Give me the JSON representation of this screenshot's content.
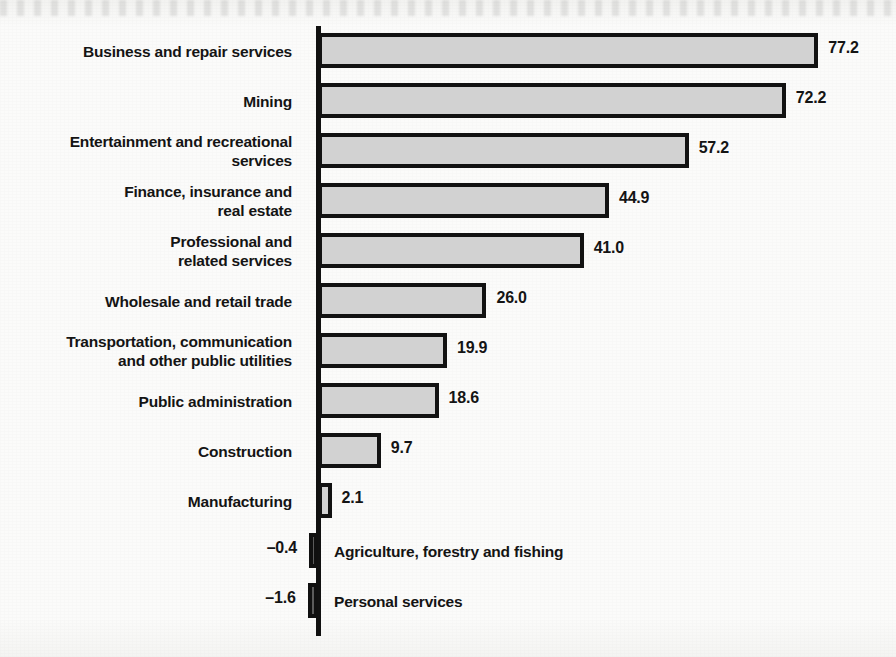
{
  "chart_data": {
    "type": "bar",
    "orientation": "horizontal",
    "title": "",
    "xlabel": "",
    "ylabel": "",
    "grid": false,
    "legend": "none",
    "xlim": [
      -5,
      80
    ],
    "zero_axis": 0,
    "categories": [
      "Business and repair services",
      "Mining",
      "Entertainment and recreational services",
      "Finance, insurance and real estate",
      "Professional and related services",
      "Wholesale and retail trade",
      "Transportation, communication and other public utilities",
      "Public administration",
      "Construction",
      "Manufacturing",
      "Agriculture, forestry and fishing",
      "Personal services"
    ],
    "values": [
      77.2,
      72.2,
      57.2,
      44.9,
      41.0,
      26.0,
      19.9,
      18.6,
      9.7,
      2.1,
      -0.4,
      -1.6
    ],
    "value_labels": [
      "77.2",
      "72.2",
      "57.2",
      "44.9",
      "41.0",
      "26.0",
      "19.9",
      "18.6",
      "9.7",
      "2.1",
      "–0.4",
      "–1.6"
    ]
  },
  "bars": [
    {
      "label_line1": "Business and repair services",
      "label_line2": "",
      "value_label": "77.2",
      "value": 77.2,
      "negative": false,
      "label_inside": false
    },
    {
      "label_line1": "Mining",
      "label_line2": "",
      "value_label": "72.2",
      "value": 72.2,
      "negative": false,
      "label_inside": false
    },
    {
      "label_line1": "Entertainment and recreational",
      "label_line2": "services",
      "value_label": "57.2",
      "value": 57.2,
      "negative": false,
      "label_inside": false
    },
    {
      "label_line1": "Finance, insurance and",
      "label_line2": "real estate",
      "value_label": "44.9",
      "value": 44.9,
      "negative": false,
      "label_inside": false
    },
    {
      "label_line1": "Professional and",
      "label_line2": "related services",
      "value_label": "41.0",
      "value": 41.0,
      "negative": false,
      "label_inside": false
    },
    {
      "label_line1": "Wholesale and retail trade",
      "label_line2": "",
      "value_label": "26.0",
      "value": 26.0,
      "negative": false,
      "label_inside": false
    },
    {
      "label_line1": "Transportation, communication",
      "label_line2": "and other public utilities",
      "value_label": "19.9",
      "value": 19.9,
      "negative": false,
      "label_inside": false
    },
    {
      "label_line1": "Public administration",
      "label_line2": "",
      "value_label": "18.6",
      "value": 18.6,
      "negative": false,
      "label_inside": false
    },
    {
      "label_line1": "Construction",
      "label_line2": "",
      "value_label": "9.7",
      "value": 9.7,
      "negative": false,
      "label_inside": false
    },
    {
      "label_line1": "Manufacturing",
      "label_line2": "",
      "value_label": "2.1",
      "value": 2.1,
      "negative": false,
      "label_inside": false
    },
    {
      "label_line1": "Agriculture, forestry and fishing",
      "label_line2": "",
      "value_label": "–0.4",
      "value": -0.4,
      "negative": true,
      "label_inside": true
    },
    {
      "label_line1": "Personal services",
      "label_line2": "",
      "value_label": "–1.6",
      "value": -1.6,
      "negative": true,
      "label_inside": true
    }
  ],
  "style": {
    "bar_fill": "#d2d2d2",
    "bar_fill_negative": "#5b5b5b",
    "bar_stroke": "#121212",
    "axis_color": "#111111",
    "text_color": "#141414",
    "background": "#fbfbfa"
  }
}
